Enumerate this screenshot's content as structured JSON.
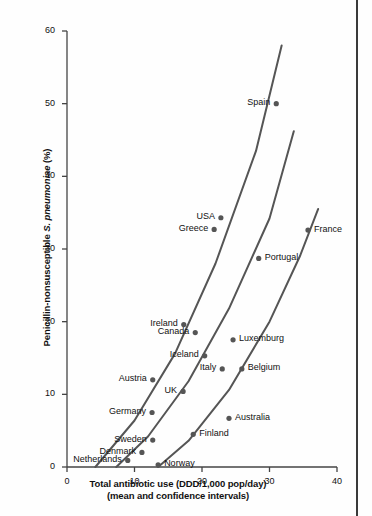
{
  "chart_data": {
    "type": "scatter",
    "title": "",
    "xlabel": "Total antibiotic use (DDD/1,000 pop/day)",
    "xlabel_line2": "(mean and confidence intervals)",
    "ylabel_prefix": "Penicillin-nonsusceptible ",
    "ylabel_species": "S. pneumoniae",
    "ylabel_suffix": " (%)",
    "xlim": [
      0,
      40
    ],
    "ylim": [
      0,
      60
    ],
    "xticks": [
      0,
      10,
      20,
      30,
      40
    ],
    "yticks": [
      0,
      10,
      20,
      30,
      40,
      50,
      60
    ],
    "grid": false,
    "legend": "none",
    "point_color": "#555555",
    "line_color": "#555555",
    "axis_color": "#444444",
    "text_color": "#111111",
    "points": [
      {
        "name": "Spain",
        "x": 31.0,
        "y": 50.0,
        "label_side": "left"
      },
      {
        "name": "USA",
        "x": 22.8,
        "y": 34.3,
        "label_side": "left"
      },
      {
        "name": "Greece",
        "x": 21.8,
        "y": 32.7,
        "label_side": "left"
      },
      {
        "name": "France",
        "x": 35.7,
        "y": 32.6,
        "label_side": "right"
      },
      {
        "name": "Portugal",
        "x": 28.4,
        "y": 28.7,
        "label_side": "right"
      },
      {
        "name": "Ireland",
        "x": 17.3,
        "y": 19.6,
        "label_side": "left"
      },
      {
        "name": "Canada",
        "x": 19.0,
        "y": 18.5,
        "label_side": "left"
      },
      {
        "name": "Luxemburg",
        "x": 24.6,
        "y": 17.5,
        "label_side": "right"
      },
      {
        "name": "Iceland",
        "x": 20.4,
        "y": 15.3,
        "label_side": "left"
      },
      {
        "name": "Italy",
        "x": 23.0,
        "y": 13.5,
        "label_side": "left"
      },
      {
        "name": "Belgium",
        "x": 25.9,
        "y": 13.5,
        "label_side": "right"
      },
      {
        "name": "Austria",
        "x": 12.7,
        "y": 12.0,
        "label_side": "left"
      },
      {
        "name": "UK",
        "x": 17.2,
        "y": 10.4,
        "label_side": "left"
      },
      {
        "name": "Germany",
        "x": 12.6,
        "y": 7.5,
        "label_side": "left"
      },
      {
        "name": "Australia",
        "x": 24.0,
        "y": 6.7,
        "label_side": "right"
      },
      {
        "name": "Sweden",
        "x": 12.7,
        "y": 3.7,
        "label_side": "left"
      },
      {
        "name": "Finland",
        "x": 18.7,
        "y": 4.5,
        "label_side": "right"
      },
      {
        "name": "Denmark",
        "x": 11.1,
        "y": 2.0,
        "label_side": "left"
      },
      {
        "name": "Netherlands",
        "x": 9.0,
        "y": 0.9,
        "label_side": "left"
      },
      {
        "name": "Norway",
        "x": 13.5,
        "y": 0.3,
        "label_side": "right"
      }
    ],
    "confidence_curves": [
      {
        "name": "upper-confidence-interval",
        "points": [
          [
            4.2,
            0.0
          ],
          [
            10.0,
            6.4
          ],
          [
            16.0,
            15.6
          ],
          [
            22.0,
            28.0
          ],
          [
            28.0,
            43.5
          ],
          [
            31.8,
            58.0
          ]
        ]
      },
      {
        "name": "mean-line",
        "points": [
          [
            7.3,
            0.0
          ],
          [
            12.0,
            4.2
          ],
          [
            18.0,
            11.8
          ],
          [
            24.0,
            21.8
          ],
          [
            30.0,
            34.2
          ],
          [
            33.6,
            46.2
          ]
        ]
      },
      {
        "name": "lower-confidence-interval",
        "points": [
          [
            13.5,
            0.0
          ],
          [
            18.0,
            3.6
          ],
          [
            24.0,
            10.6
          ],
          [
            30.0,
            20.0
          ],
          [
            34.5,
            29.0
          ],
          [
            37.2,
            35.5
          ]
        ]
      }
    ]
  }
}
